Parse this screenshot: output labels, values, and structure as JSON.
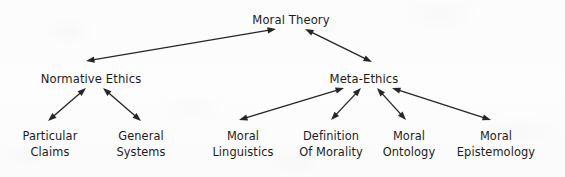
{
  "diagram": {
    "title_node": "Moral Theory",
    "nodes": [
      {
        "id": "moral-theory",
        "label": "Moral Theory",
        "lines": [
          "Moral Theory"
        ],
        "x": 291,
        "y": 12,
        "level": 0
      },
      {
        "id": "normative-ethics",
        "label": "Normative Ethics",
        "lines": [
          "Normative Ethics"
        ],
        "x": 91,
        "y": 71,
        "level": 1
      },
      {
        "id": "meta-ethics",
        "label": "Meta-Ethics",
        "lines": [
          "Meta-Ethics"
        ],
        "x": 364,
        "y": 71,
        "level": 1
      },
      {
        "id": "particular-claims",
        "label": "Particular Claims",
        "lines": [
          "Particular",
          "Claims"
        ],
        "x": 50,
        "y": 128,
        "level": 2
      },
      {
        "id": "general-systems",
        "label": "General Systems",
        "lines": [
          "General",
          "Systems"
        ],
        "x": 141,
        "y": 128,
        "level": 2
      },
      {
        "id": "moral-linguistics",
        "label": "Moral Linguistics",
        "lines": [
          "Moral",
          "Linguistics"
        ],
        "x": 243,
        "y": 128,
        "level": 2
      },
      {
        "id": "definition-of-morality",
        "label": "Definition Of Morality",
        "lines": [
          "Definition",
          "Of Morality"
        ],
        "x": 331,
        "y": 128,
        "level": 2
      },
      {
        "id": "moral-ontology",
        "label": "Moral Ontology",
        "lines": [
          "Moral",
          "Ontology"
        ],
        "x": 409,
        "y": 128,
        "level": 2
      },
      {
        "id": "moral-epistemology",
        "label": "Moral Epistemology",
        "lines": [
          "Moral",
          "Epistemology"
        ],
        "x": 496,
        "y": 128,
        "level": 2
      }
    ],
    "edges": [
      {
        "id": "edge-moral-theory-normative-ethics",
        "from": "moral-theory",
        "to": "normative-ethics",
        "arrowheads": "both",
        "x1": 276,
        "y1": 29,
        "x2": 86,
        "y2": 61
      },
      {
        "id": "edge-moral-theory-meta-ethics",
        "from": "moral-theory",
        "to": "meta-ethics",
        "arrowheads": "both",
        "x1": 305,
        "y1": 29,
        "x2": 372,
        "y2": 62
      },
      {
        "id": "edge-normative-ethics-particular-claims",
        "from": "normative-ethics",
        "to": "particular-claims",
        "arrowheads": "both",
        "x1": 86,
        "y1": 88,
        "x2": 48,
        "y2": 121
      },
      {
        "id": "edge-normative-ethics-general-systems",
        "from": "normative-ethics",
        "to": "general-systems",
        "arrowheads": "both",
        "x1": 103,
        "y1": 88,
        "x2": 141,
        "y2": 121
      },
      {
        "id": "edge-meta-ethics-moral-linguistics",
        "from": "meta-ethics",
        "to": "moral-linguistics",
        "arrowheads": "both",
        "x1": 344,
        "y1": 88,
        "x2": 239,
        "y2": 120
      },
      {
        "id": "edge-meta-ethics-definition-of-morality",
        "from": "meta-ethics",
        "to": "definition-of-morality",
        "arrowheads": "both",
        "x1": 361,
        "y1": 88,
        "x2": 331,
        "y2": 120
      },
      {
        "id": "edge-meta-ethics-moral-ontology",
        "from": "meta-ethics",
        "to": "moral-ontology",
        "arrowheads": "both",
        "x1": 377,
        "y1": 88,
        "x2": 406,
        "y2": 120
      },
      {
        "id": "edge-meta-ethics-moral-epistemology",
        "from": "meta-ethics",
        "to": "moral-epistemology",
        "arrowheads": "both",
        "x1": 392,
        "y1": 88,
        "x2": 491,
        "y2": 120
      }
    ],
    "colors": {
      "ink": "#1c1c1c",
      "edge": "#262626",
      "background": "#fdfdfd"
    }
  }
}
